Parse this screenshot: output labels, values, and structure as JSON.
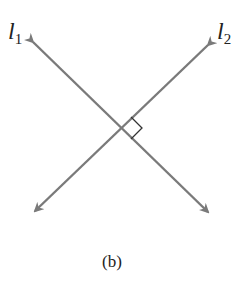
{
  "diagram": {
    "lines": [
      {
        "name": "l",
        "subscript": "1",
        "from": [
          33,
          42
        ],
        "to": [
          208,
          212
        ]
      },
      {
        "name": "l",
        "subscript": "2",
        "from": [
          208,
          45
        ],
        "to": [
          35,
          211
        ]
      }
    ],
    "intersection": [
      120,
      127
    ],
    "right_angle_marker": true,
    "line_color": "#7a7a7a",
    "caption": "(b)"
  }
}
